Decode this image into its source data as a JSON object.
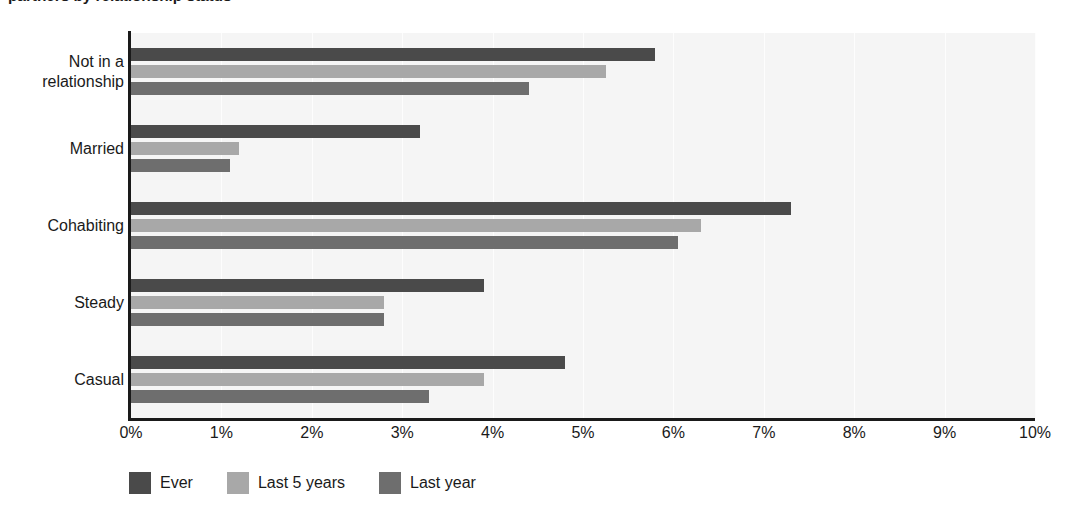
{
  "chart_data": {
    "type": "bar",
    "orientation": "horizontal",
    "title": "partners by relationship status",
    "xlabel": "",
    "ylabel": "",
    "xlim": [
      0,
      10
    ],
    "xunit": "%",
    "xticks": [
      "0%",
      "1%",
      "2%",
      "3%",
      "4%",
      "5%",
      "6%",
      "7%",
      "8%",
      "9%",
      "10%"
    ],
    "xtick_values": [
      0,
      1,
      2,
      3,
      4,
      5,
      6,
      7,
      8,
      9,
      10
    ],
    "grid": true,
    "legend_position": "bottom-left",
    "categories": [
      "Not in a\nrelationship",
      "Married",
      "Cohabiting",
      "Steady",
      "Casual"
    ],
    "category_labels": [
      [
        "Not in a",
        "relationship"
      ],
      [
        "Married"
      ],
      [
        "Cohabiting"
      ],
      [
        "Steady"
      ],
      [
        "Casual"
      ]
    ],
    "series": [
      {
        "name": "Ever",
        "color": "#4a4a4a",
        "values": [
          5.8,
          3.2,
          7.3,
          3.9,
          4.8
        ]
      },
      {
        "name": "Last 5 years",
        "color": "#a8a8a8",
        "values": [
          5.25,
          1.2,
          6.3,
          2.8,
          3.9
        ]
      },
      {
        "name": "Last year",
        "color": "#6e6e6e",
        "values": [
          4.4,
          1.1,
          6.05,
          2.8,
          3.3
        ]
      }
    ]
  },
  "colors": {
    "plot_background": "#f5f5f5",
    "page_background": "#ffffff",
    "axis": "#1a1a1a",
    "gridline": "#fdfdfd",
    "text": "#1a1a1a"
  }
}
